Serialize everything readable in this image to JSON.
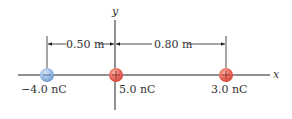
{
  "axes": {
    "x_label": "x",
    "y_label": "y"
  },
  "dimensions": [
    {
      "label": "0.50 m",
      "from": "charge-1",
      "to": "origin"
    },
    {
      "label": "0.80 m",
      "from": "origin",
      "to": "charge-3"
    }
  ],
  "charges": [
    {
      "label": "−4.0 nC",
      "sign": "-",
      "color": "#8fb3e0"
    },
    {
      "label": "5.0 nC",
      "sign": "+",
      "color": "#e8605a"
    },
    {
      "label": "3.0 nC",
      "sign": "+",
      "color": "#e8605a"
    }
  ],
  "colors": {
    "line": "#222222"
  }
}
